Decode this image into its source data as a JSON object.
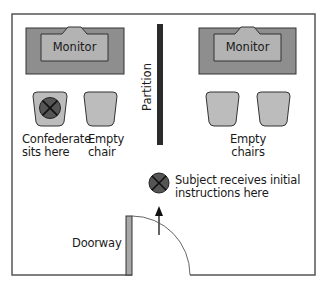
{
  "diagram": {
    "type": "floor-plan",
    "labels": {
      "monitor_left": "Monitor",
      "monitor_right": "Monitor",
      "partition": "Partition",
      "confederate_line1": "Confederate",
      "confederate_line2": "sits here",
      "empty_chair_line1": "Empty",
      "empty_chair_line2": "chair",
      "empty_chairs_line1": "Empty",
      "empty_chairs_line2": "chairs",
      "subject_line1": "Subject receives initial",
      "subject_line2": "instructions here",
      "doorway": "Doorway"
    },
    "colors": {
      "wall": "#555555",
      "monitor_outer": "#8e8e8e",
      "monitor_inner": "#b3b3b3",
      "chair": "#bcbcbc",
      "person_marker": "#555555",
      "partition": "#2b2b2b",
      "door": "#a8a8a8"
    },
    "nodes": [
      {
        "id": "monitor-left",
        "kind": "monitor"
      },
      {
        "id": "monitor-right",
        "kind": "monitor"
      },
      {
        "id": "partition",
        "kind": "wall"
      },
      {
        "id": "chair-confederate",
        "kind": "chair",
        "occupied": true
      },
      {
        "id": "chair-empty-left",
        "kind": "chair",
        "occupied": false
      },
      {
        "id": "chair-empty-right-1",
        "kind": "chair",
        "occupied": false
      },
      {
        "id": "chair-empty-right-2",
        "kind": "chair",
        "occupied": false
      },
      {
        "id": "subject-position",
        "kind": "person-marker"
      },
      {
        "id": "doorway",
        "kind": "door"
      }
    ],
    "edges": [
      {
        "from": "doorway",
        "to": "subject-position",
        "kind": "arrow"
      }
    ]
  }
}
